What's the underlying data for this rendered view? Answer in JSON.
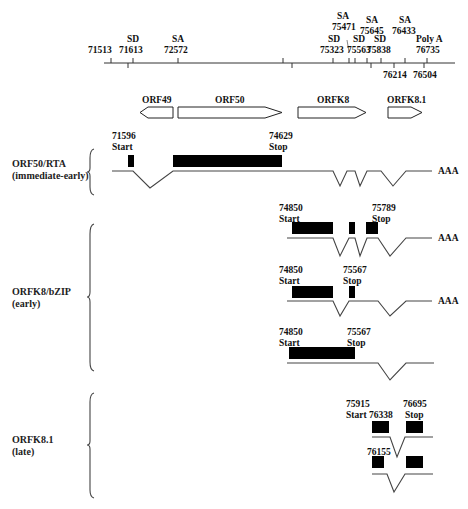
{
  "axis": {
    "above_ticks": [
      {
        "label": "71513",
        "x": 111,
        "tag": ""
      },
      {
        "label": "71613",
        "x": 133,
        "tag": "SD"
      },
      {
        "label": "72572",
        "x": 178,
        "tag": "SA"
      },
      {
        "label": "75323",
        "x": 333,
        "tag": "SD"
      },
      {
        "label": "75471",
        "x": 349,
        "tag": "SA"
      },
      {
        "label": "75563",
        "x": 355,
        "tag": "SD"
      },
      {
        "label": "75645",
        "x": 367,
        "tag": "SA"
      },
      {
        "label": "75838",
        "x": 381,
        "tag": "SD"
      },
      {
        "label": "76433",
        "x": 405,
        "tag": "SA"
      },
      {
        "label": "76735",
        "x": 427,
        "tag": "Poly A"
      }
    ],
    "below_ticks": [
      {
        "label": "",
        "x": 128
      },
      {
        "label": "",
        "x": 292
      },
      {
        "label": "",
        "x": 371
      },
      {
        "label": "76214",
        "x": 394
      },
      {
        "label": "76504",
        "x": 424
      }
    ],
    "extra_tick_x": 283
  },
  "orfs": [
    {
      "name": "ORF49",
      "direction": "left"
    },
    {
      "name": "ORF50",
      "direction": "right"
    },
    {
      "name": "ORFK8",
      "direction": "right"
    },
    {
      "name": "ORFK8.1",
      "direction": "right"
    }
  ],
  "groups": [
    {
      "title": "ORF50/RTA",
      "subtitle": "(immediate-early)"
    },
    {
      "title": "ORFK8/bZIP",
      "subtitle": "(early)"
    },
    {
      "title": "ORFK8.1",
      "subtitle": "(late)"
    }
  ],
  "transcripts": {
    "rta": {
      "start_pos": "71596",
      "start": "Start",
      "stop_pos": "74629",
      "stop": "Stop",
      "polyA": "AAA"
    },
    "k8_a": {
      "start_pos": "74850",
      "start": "Start",
      "stop_pos": "75789",
      "stop": "Stop",
      "polyA": "AAA"
    },
    "k8_b": {
      "start_pos": "74850",
      "start": "Start",
      "stop_pos": "75567",
      "stop": "Stop",
      "polyA": "AAA"
    },
    "k8_c": {
      "start_pos": "74850",
      "start": "Start",
      "stop_pos": "75567",
      "stop": "Stop"
    },
    "k81_a": {
      "start_pos": "75915",
      "start": "Start",
      "mid_pos": "76338",
      "stop_pos": "76695",
      "stop": "Stop"
    },
    "k81_b": {
      "mid_pos": "76155"
    }
  }
}
